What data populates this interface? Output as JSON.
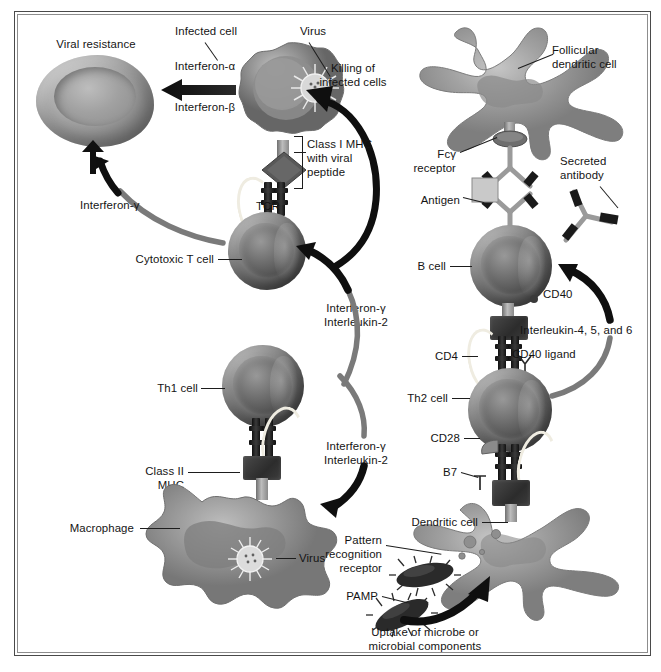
{
  "figure": {
    "domain": "biology-diagram",
    "background_color": "#ffffff",
    "frame_color": "#4a4a4a"
  },
  "left_panel": {
    "name": "cell-mediated-immunity",
    "labels": {
      "viral_resistance": "Viral resistance",
      "infected_cell": "Infected cell",
      "virus_top": "Virus",
      "interferon_alpha": "Interferon-α",
      "interferon_beta": "Interferon-β",
      "killing_line1": "Killing of",
      "killing_line2": "infected cells",
      "class_i_mhc_line1": "Class I MHC",
      "class_i_mhc_line2": "with viral",
      "class_i_mhc_line3": "peptide",
      "tcr": "TCR",
      "interferon_gamma_left": "Interferon-γ",
      "cytotoxic_t_cell": "Cytotoxic T cell",
      "cytokines_upper_line1": "Interferon-γ",
      "cytokines_upper_line2": "Interleukin-2",
      "th1_cell": "Th1 cell",
      "cytokines_lower_line1": "Interferon-γ",
      "cytokines_lower_line2": "Interleukin-2",
      "class_ii_mhc_line1": "Class II",
      "class_ii_mhc_line2": "MHC",
      "macrophage": "Macrophage",
      "virus_bottom": "Virus"
    }
  },
  "right_panel": {
    "name": "humoral-immunity",
    "labels": {
      "follicular_dendritic_line1": "Follicular",
      "follicular_dendritic_line2": "dendritic cell",
      "fc_gamma_line1": "Fcγ",
      "fc_gamma_line2": "receptor",
      "antigen": "Antigen",
      "secreted_antibody_line1": "Secreted",
      "secreted_antibody_line2": "antibody",
      "b_cell": "B cell",
      "cd40": "CD40",
      "interleukins": "Interleukin-4, 5, and 6",
      "cd4": "CD4",
      "cd40_ligand": "CD40 ligand",
      "th2_cell": "Th2 cell",
      "cd28": "CD28",
      "b7": "B7",
      "dendritic_cell": "Dendritic cell",
      "pattern_recognition_line1": "Pattern",
      "pattern_recognition_line2": "recognition",
      "pattern_recognition_line3": "receptor",
      "pamp": "PAMP",
      "uptake_line1": "Uptake of microbe or",
      "uptake_line2": "microbial components"
    }
  }
}
